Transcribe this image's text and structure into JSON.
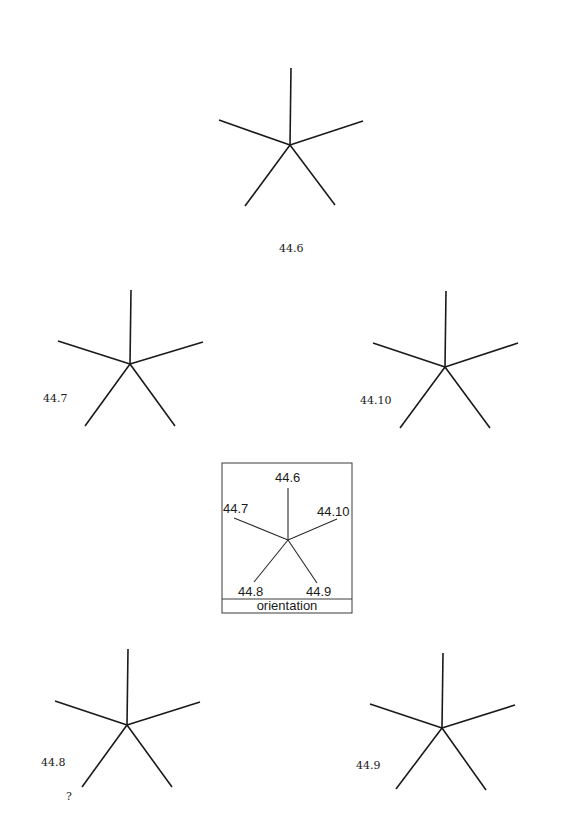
{
  "figure": {
    "stroke_color": "#1a1a1a",
    "background": "#ffffff"
  },
  "stars": [
    {
      "id": "44.6",
      "label": "44.6",
      "center": [
        290,
        145
      ],
      "arms": [
        [
          291,
          68
        ],
        [
          219,
          120
        ],
        [
          363,
          121
        ],
        [
          245,
          206
        ],
        [
          335,
          205
        ]
      ],
      "label_pos": [
        279,
        252
      ]
    },
    {
      "id": "44.7",
      "label": "44.7",
      "center": [
        130,
        364
      ],
      "arms": [
        [
          131,
          290
        ],
        [
          58,
          341
        ],
        [
          203,
          342
        ],
        [
          85,
          426
        ],
        [
          175,
          426
        ]
      ],
      "label_pos": [
        43,
        402
      ]
    },
    {
      "id": "44.10",
      "label": "44.10",
      "center": [
        445,
        367
      ],
      "arms": [
        [
          446,
          291
        ],
        [
          373,
          343
        ],
        [
          518,
          343
        ],
        [
          400,
          428
        ],
        [
          490,
          428
        ]
      ],
      "label_pos": [
        360,
        404
      ]
    },
    {
      "id": "44.8",
      "label": "44.8",
      "center": [
        127,
        725
      ],
      "arms": [
        [
          128,
          649
        ],
        [
          55,
          701
        ],
        [
          200,
          702
        ],
        [
          82,
          787
        ],
        [
          172,
          787
        ]
      ],
      "label_pos": [
        41,
        766
      ],
      "annotation": "?",
      "annotation_pos": [
        66,
        800
      ]
    },
    {
      "id": "44.9",
      "label": "44.9",
      "center": [
        442,
        728
      ],
      "arms": [
        [
          443,
          653
        ],
        [
          370,
          704
        ],
        [
          515,
          705
        ],
        [
          396,
          789
        ],
        [
          486,
          790
        ]
      ],
      "label_pos": [
        356,
        769
      ]
    }
  ],
  "orientation_key": {
    "title": "orientation",
    "box": {
      "x": 222,
      "y": 463,
      "width": 130,
      "height": 150,
      "divider_y": 599
    },
    "center": [
      288,
      540
    ],
    "arms": [
      {
        "label": "44.6",
        "end": [
          288,
          488
        ],
        "label_pos": [
          275,
          482
        ]
      },
      {
        "label": "44.7",
        "end": [
          234,
          518
        ],
        "label_pos": [
          223,
          513
        ]
      },
      {
        "label": "44.10",
        "end": [
          337,
          519
        ],
        "label_pos": [
          317,
          516
        ]
      },
      {
        "label": "44.8",
        "end": [
          254,
          582
        ],
        "label_pos": [
          238,
          596
        ]
      },
      {
        "label": "44.9",
        "end": [
          317,
          583
        ],
        "label_pos": [
          306,
          596
        ]
      }
    ],
    "title_pos": [
      287,
      610
    ]
  }
}
